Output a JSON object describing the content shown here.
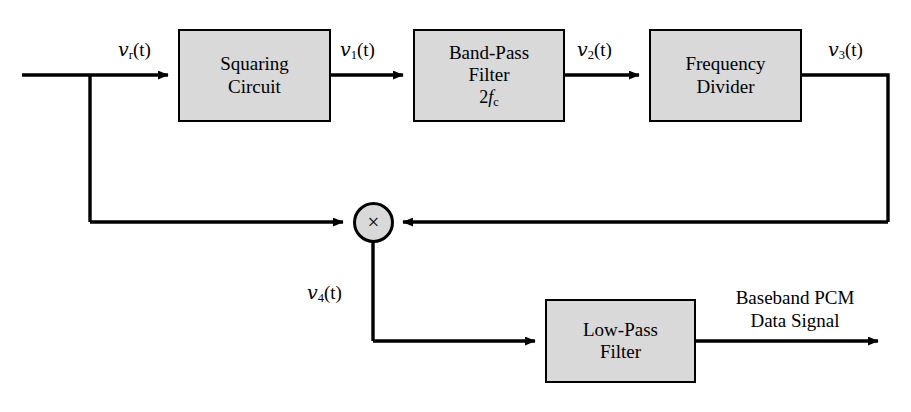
{
  "diagram": {
    "line_color": "#000000",
    "block_fill": "#d9d9d9",
    "background": "#ffffff",
    "blocks": [
      {
        "id": "squaring-circuit",
        "label": "Squaring\nCircuit",
        "x": 178,
        "y": 29,
        "w": 153,
        "h": 93
      },
      {
        "id": "band-pass-filter",
        "label": "Band-Pass\nFilter",
        "sublabel": "2f_c",
        "sub_num": "2",
        "sub_var": "f",
        "sub_idx": "c",
        "x": 413,
        "y": 29,
        "w": 152,
        "h": 93
      },
      {
        "id": "frequency-divider",
        "label": "Frequency\nDivider",
        "x": 649,
        "y": 29,
        "w": 153,
        "h": 93
      },
      {
        "id": "low-pass-filter",
        "label": "Low-Pass\nFilter",
        "x": 545,
        "y": 299,
        "w": 151,
        "h": 84
      }
    ],
    "multiplier": {
      "id": "multiplier",
      "symbol": "×",
      "cx": 373,
      "cy": 222,
      "r": 20
    },
    "signals": [
      {
        "id": "v-r",
        "var": "v",
        "sub": "r",
        "suffix": "(t)",
        "x": 118,
        "y": 38
      },
      {
        "id": "v-1",
        "var": "v",
        "sub": "1",
        "suffix": "(t)",
        "x": 340,
        "y": 38
      },
      {
        "id": "v-2",
        "var": "v",
        "sub": "2",
        "suffix": "(t)",
        "x": 577,
        "y": 38
      },
      {
        "id": "v-3",
        "var": "v",
        "sub": "3",
        "suffix": "(t)",
        "x": 828,
        "y": 38
      },
      {
        "id": "v-4",
        "var": "v",
        "sub": "4",
        "suffix": "(t)",
        "x": 307,
        "y": 281
      }
    ],
    "output_label": {
      "id": "baseband-pcm-output-label",
      "text": "Baseband PCM\nData Signal",
      "x": 700,
      "y": 287,
      "w": 190
    }
  }
}
